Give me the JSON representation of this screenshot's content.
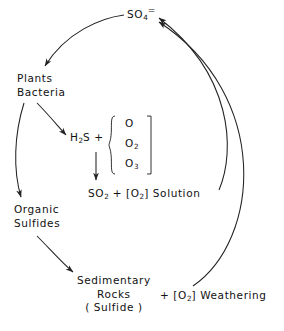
{
  "figure": {
    "stroke_color": "#222222",
    "background": "#ffffff"
  },
  "nodes": {
    "sulfate": {
      "formula": "SO",
      "sub": "4",
      "charge": "="
    },
    "plants": {
      "line1": "Plants",
      "line2": "Bacteria"
    },
    "hydrogen_sulfide": {
      "pre": "H",
      "sub": "2",
      "post": "S",
      "plus": "+"
    },
    "oxidants": {
      "items": [
        {
          "symbol": "O",
          "sub": ""
        },
        {
          "symbol": "O",
          "sub": "2"
        },
        {
          "symbol": "O",
          "sub": "3"
        }
      ]
    },
    "sulfur_dioxide_solution": {
      "formula": "SO",
      "sub": "2",
      "plus": "+",
      "bracket_open": "[",
      "oxygen": "O",
      "oxygen_sub": "2",
      "bracket_close": "]",
      "state": "Solution"
    },
    "organic_sulfides": {
      "line1": "Organic",
      "line2": "Sulfides"
    },
    "sedimentary_rocks": {
      "line1": "Sedimentary",
      "line2": "Rocks",
      "line3": "( Sulfide )"
    },
    "weathering": {
      "plus": "+",
      "bracket_open": "[",
      "oxygen": "O",
      "oxygen_sub": "2",
      "bracket_close": "]",
      "label": "Weathering"
    }
  },
  "edges": [
    {
      "name": "sulfate-to-plants",
      "from": "sulfate",
      "to": "plants"
    },
    {
      "name": "plants-to-h2s",
      "from": "plants",
      "to": "hydrogen_sulfide"
    },
    {
      "name": "plants-to-organic-sulfides",
      "from": "plants",
      "to": "organic_sulfides"
    },
    {
      "name": "h2s-to-so2-solution",
      "from": "hydrogen_sulfide",
      "to": "sulfur_dioxide_solution"
    },
    {
      "name": "organic-sulfides-to-sedimentary-rocks",
      "from": "organic_sulfides",
      "to": "sedimentary_rocks"
    },
    {
      "name": "so2-solution-to-sulfate",
      "from": "sulfur_dioxide_solution",
      "to": "sulfate"
    },
    {
      "name": "weathering-to-sulfate",
      "from": "weathering",
      "to": "sulfate"
    }
  ],
  "caption": ""
}
